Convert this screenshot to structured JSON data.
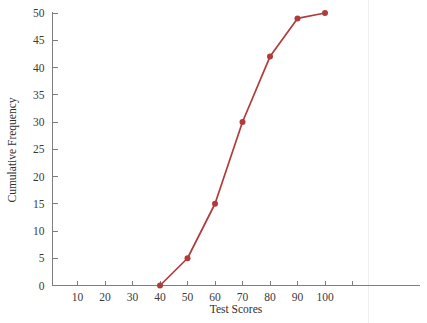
{
  "chart_data": {
    "type": "line",
    "title": "",
    "subtitle": "",
    "xlabel": "Test Scores",
    "ylabel": "Cumulative Frequency",
    "x": [
      40,
      50,
      60,
      70,
      80,
      90,
      100
    ],
    "values": [
      0,
      5,
      15,
      30,
      42,
      49,
      50
    ],
    "series": [
      {
        "name": "Cumulative Frequency",
        "x": [
          40,
          50,
          60,
          70,
          80,
          90,
          100
        ],
        "values": [
          0,
          5,
          15,
          30,
          42,
          49,
          50
        ],
        "color": "#b03b3b",
        "marker": "circle"
      }
    ],
    "xlim": [
      0,
      115
    ],
    "ylim": [
      0,
      50
    ],
    "xticks": [
      10,
      20,
      30,
      40,
      50,
      60,
      70,
      80,
      90,
      100,
      110
    ],
    "xtick_labels": [
      "10",
      "20",
      "30",
      "40",
      "50",
      "60",
      "70",
      "80",
      "90",
      "100",
      ""
    ],
    "yticks": [
      0,
      5,
      10,
      15,
      20,
      25,
      30,
      35,
      40,
      45,
      50
    ],
    "ytick_labels": [
      "0",
      "5",
      "10",
      "15",
      "20",
      "25",
      "30",
      "35",
      "40",
      "45",
      "50"
    ],
    "grid": false,
    "legend": false,
    "legend_position": "none",
    "annotations": []
  },
  "style": {
    "line_color": "#b03b3b",
    "marker_color": "#b03b3b",
    "axis_color": "#7e7e7e",
    "text_color": "#2f2f2f",
    "background": "#ffffff"
  },
  "axis_titles": {
    "x": "Test Scores",
    "y": "Cumulative Frequency"
  }
}
